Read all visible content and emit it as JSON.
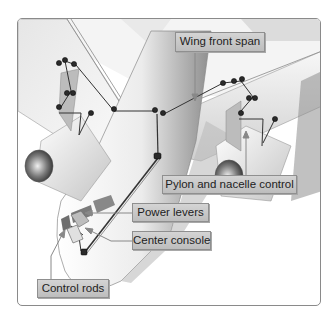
{
  "diagram": {
    "type": "aircraft engine control system illustration",
    "labels": [
      {
        "id": "wing_front_span",
        "text": "Wing front span"
      },
      {
        "id": "pylon_nacelle_control",
        "text": "Pylon and nacelle control"
      },
      {
        "id": "power_levers",
        "text": "Power levers"
      },
      {
        "id": "center_console",
        "text": "Center console"
      },
      {
        "id": "control_rods",
        "text": "Control rods"
      }
    ],
    "components": [
      "left engine",
      "right engine",
      "fuselage",
      "left wing",
      "right wing",
      "cockpit",
      "cable runs",
      "pulleys",
      "bellcranks"
    ]
  },
  "colors": {
    "frame_border": "#8a8a8a",
    "label_bg": "#c8c8c8",
    "label_border": "#8f8f8f",
    "label_text": "#222222",
    "aircraft_light": "#f2f2f2",
    "aircraft_shadow": "#9a9a9a",
    "linkage": "#333333"
  }
}
